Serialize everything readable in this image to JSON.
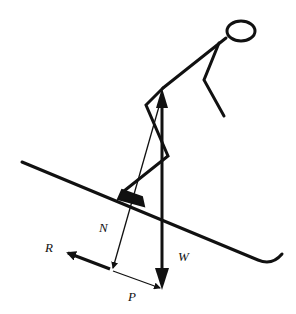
{
  "diagram": {
    "labels": {
      "normal": "N",
      "weight": "W",
      "resistance": "R",
      "parallel": "P"
    },
    "colors": {
      "ink": "#111111",
      "background": "#ffffff"
    }
  }
}
